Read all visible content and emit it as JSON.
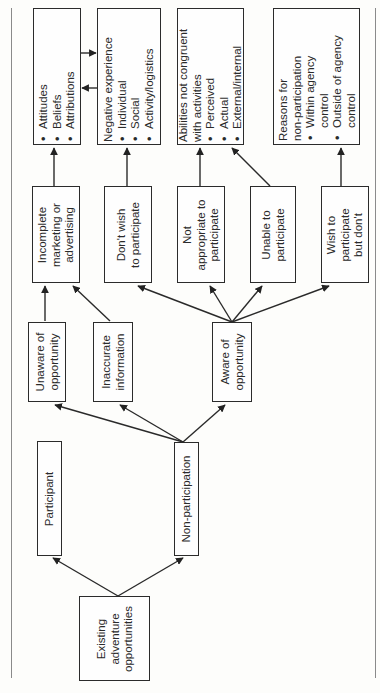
{
  "diagram": {
    "type": "flowchart",
    "orientation": "rotated 90 degrees counter-clockwise",
    "nodes": {
      "existing": {
        "lines": [
          "Existing",
          "adventure",
          "opportunities"
        ]
      },
      "participant": {
        "lines": [
          "Participant"
        ]
      },
      "non_participation": {
        "lines": [
          "Non-participation"
        ]
      },
      "unaware": {
        "lines": [
          "Unaware of",
          "opportunity"
        ]
      },
      "inaccurate": {
        "lines": [
          "Inaccurate",
          "information"
        ]
      },
      "aware": {
        "lines": [
          "Aware of",
          "opportunity"
        ]
      },
      "incomplete": {
        "lines": [
          "Incomplete",
          "marketing or",
          "advertising"
        ]
      },
      "dont_wish": {
        "lines": [
          "Don't wish",
          "to participate"
        ]
      },
      "not_appropriate": {
        "lines": [
          "Not",
          "appropriate to",
          "participate"
        ]
      },
      "unable": {
        "lines": [
          "Unable to",
          "participate"
        ]
      },
      "wish_but_dont": {
        "lines": [
          "Wish to",
          "participate",
          "but don't"
        ]
      },
      "attitudes": {
        "heading": "",
        "bullets": [
          "Attitudes",
          "Beliefs",
          "Attributions"
        ]
      },
      "negative_experience": {
        "heading": "Negative experience",
        "bullets": [
          "Individual",
          "Social",
          "Activity/logistics"
        ]
      },
      "abilities": {
        "heading_lines": [
          "Abilities not congruent",
          "with activities"
        ],
        "bullets": [
          "Perceived",
          "Actual",
          "External/internal"
        ]
      },
      "reasons": {
        "heading_lines": [
          "Reasons for",
          "non-participation"
        ],
        "bullets": [
          [
            "Within agency",
            "control"
          ],
          [
            "Outside of agency",
            "control"
          ]
        ]
      }
    },
    "edges": [
      [
        "Existing adventure opportunities",
        "Participant"
      ],
      [
        "Existing adventure opportunities",
        "Non-participation"
      ],
      [
        "Non-participation",
        "Unaware of opportunity"
      ],
      [
        "Non-participation",
        "Inaccurate information"
      ],
      [
        "Non-participation",
        "Aware of opportunity"
      ],
      [
        "Unaware of opportunity",
        "Incomplete marketing or advertising"
      ],
      [
        "Inaccurate information",
        "Incomplete marketing or advertising"
      ],
      [
        "Aware of opportunity",
        "Don't wish to participate"
      ],
      [
        "Aware of opportunity",
        "Not appropriate to participate"
      ],
      [
        "Aware of opportunity",
        "Unable to participate"
      ],
      [
        "Aware of opportunity",
        "Wish to participate but don't"
      ],
      [
        "Incomplete marketing or advertising",
        "Attitudes / Beliefs / Attributions"
      ],
      [
        "Don't wish to participate",
        "Negative experience"
      ],
      [
        "Not appropriate to participate",
        "Abilities not congruent with activities"
      ],
      [
        "Unable to participate",
        "Abilities not congruent with activities"
      ],
      [
        "Wish to participate but don't",
        "Reasons for non-participation"
      ],
      [
        "Attitudes / Beliefs / Attributions",
        "Negative experience",
        "bidirectional"
      ]
    ]
  }
}
